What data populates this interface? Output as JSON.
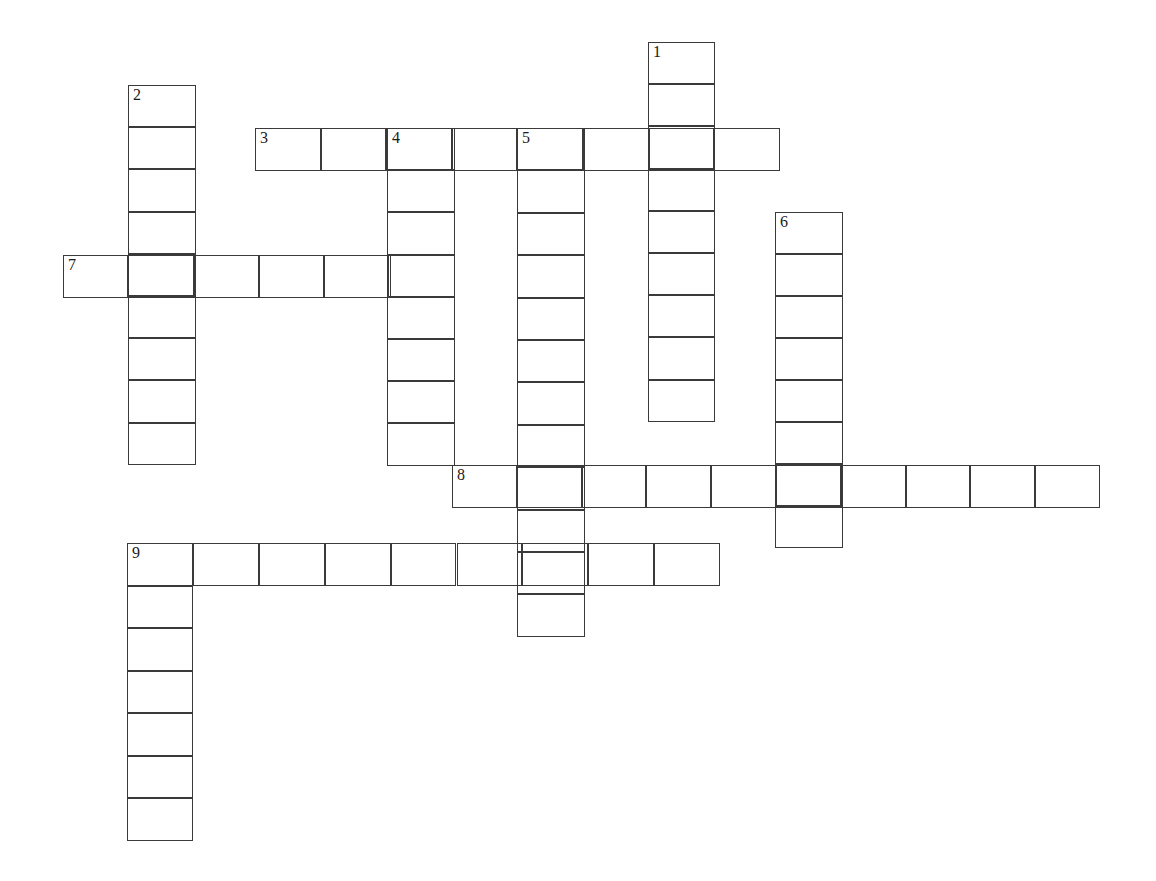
{
  "page": {
    "background_color": "#ffffff",
    "grid_line_color": "#3a3a3a",
    "number_color": "#1a1a1a",
    "width": 1156,
    "height": 881
  },
  "grid": {
    "cell_width": 65.5,
    "cell_height": 42.5,
    "entry_count": 9,
    "across_count": 4,
    "down_count": 5
  },
  "entries": [
    {
      "number": "1",
      "direction": "down",
      "length": 9,
      "x": 648,
      "y": 42,
      "cell_w": 67,
      "cell_h": 42.2,
      "letters": [
        "",
        "",
        "",
        "",
        "",
        "",
        "",
        "",
        ""
      ]
    },
    {
      "number": "2",
      "direction": "down",
      "length": 9,
      "x": 128,
      "y": 85,
      "cell_w": 68,
      "cell_h": 42.2,
      "letters": [
        "",
        "",
        "",
        "",
        "",
        "",
        "",
        "",
        ""
      ]
    },
    {
      "number": "3",
      "direction": "across",
      "length": 8,
      "x": 255,
      "y": 128,
      "cell_w": 65.6,
      "cell_h": 43,
      "letters": [
        "",
        "",
        "",
        "",
        "",
        "",
        "",
        ""
      ]
    },
    {
      "number": "4",
      "direction": "down",
      "length": 8,
      "x": 387,
      "y": 128,
      "cell_w": 68,
      "cell_h": 42.2,
      "letters": [
        "",
        "",
        "",
        "",
        "",
        "",
        "",
        ""
      ]
    },
    {
      "number": "5",
      "direction": "down",
      "length": 12,
      "x": 517,
      "y": 128,
      "cell_w": 68,
      "cell_h": 42.4,
      "letters": [
        "",
        "",
        "",
        "",
        "",
        "",
        "",
        "",
        "",
        "",
        "",
        ""
      ]
    },
    {
      "number": "6",
      "direction": "down",
      "length": 8,
      "x": 775,
      "y": 212,
      "cell_w": 68,
      "cell_h": 42,
      "letters": [
        "",
        "",
        "",
        "",
        "",
        "",
        "",
        ""
      ]
    },
    {
      "number": "7",
      "direction": "across",
      "length": 6,
      "x": 63,
      "y": 255,
      "cell_w": 65.3,
      "cell_h": 43,
      "letters": [
        "",
        "",
        "",
        "",
        "",
        ""
      ]
    },
    {
      "number": "8",
      "direction": "across",
      "length": 10,
      "x": 452,
      "y": 465,
      "cell_w": 64.8,
      "cell_h": 43,
      "letters": [
        "",
        "",
        "",
        "",
        "",
        "",
        "",
        "",
        "",
        ""
      ]
    },
    {
      "number": "9",
      "direction": "across",
      "length": 9,
      "x": 127,
      "y": 543,
      "cell_w": 65.9,
      "cell_h": 43,
      "letters": [
        "",
        "",
        "",
        "",
        "",
        "",
        "",
        "",
        ""
      ]
    },
    {
      "number": "9",
      "direction": "down",
      "length": 7,
      "x": 127,
      "y": 543,
      "cell_w": 66,
      "cell_h": 42.5,
      "show_number": false,
      "letters": [
        "",
        "",
        "",
        "",
        "",
        "",
        ""
      ]
    }
  ]
}
